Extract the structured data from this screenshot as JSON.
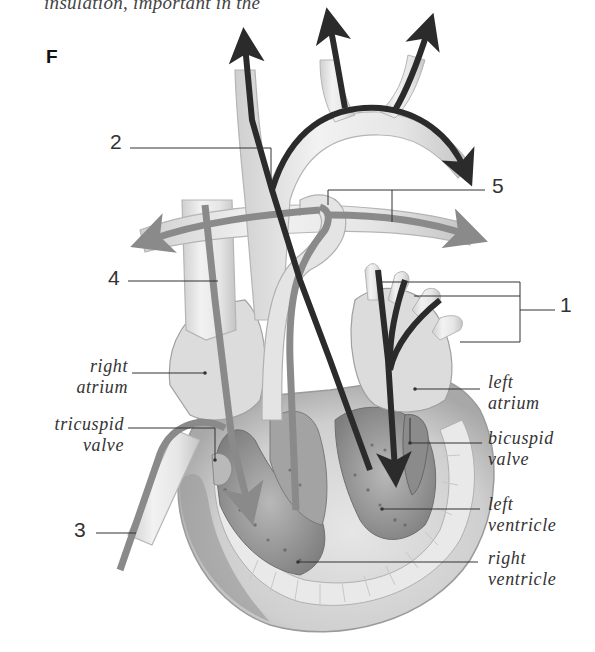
{
  "caption_fragment": "insulation, important in the",
  "panel": "F",
  "numbered_labels": {
    "n1": "1",
    "n2": "2",
    "n3": "3",
    "n4": "4",
    "n5": "5"
  },
  "labels": {
    "right_atrium": [
      "right",
      "atrium"
    ],
    "tricuspid_valve": [
      "tricuspid",
      "valve"
    ],
    "left_atrium": [
      "left",
      "atrium"
    ],
    "bicuspid_valve": [
      "bicuspid",
      "valve"
    ],
    "left_ventricle": [
      "left",
      "ventricle"
    ],
    "right_ventricle": [
      "right",
      "ventricle"
    ]
  },
  "colors": {
    "oxygenated_arrow": "#2b2b2b",
    "deoxygenated_arrow": "#8a8a8a",
    "vessel_wall": "#e4e4e4",
    "vessel_outline": "#b5b5b5",
    "muscle": "#d8d8d8",
    "chamber_dark": "#8c8c8c",
    "leader_line": "#333333"
  }
}
